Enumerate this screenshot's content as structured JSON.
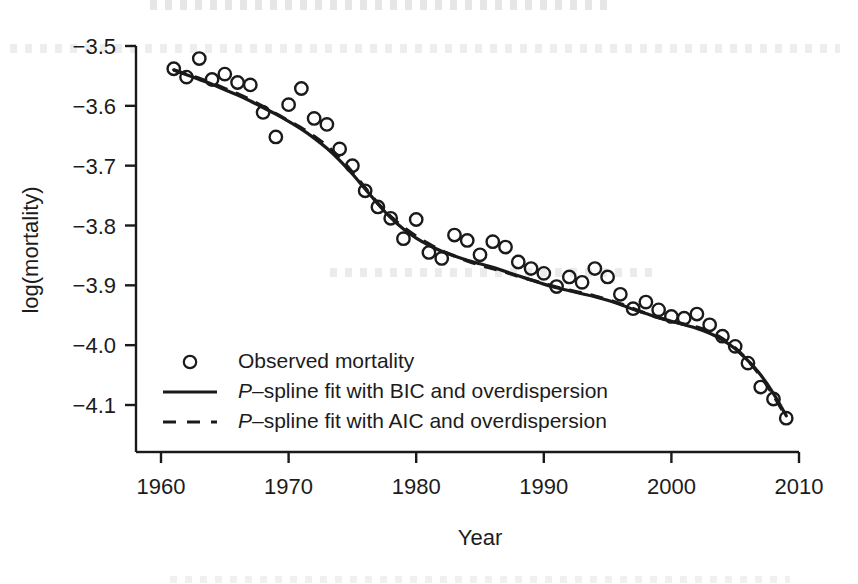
{
  "chart_data": {
    "type": "scatter",
    "title": "",
    "xlabel": "Year",
    "ylabel": "log(mortality)",
    "xlim": [
      1959.0,
      2010.6
    ],
    "ylim": [
      -4.155,
      -3.47
    ],
    "xticks": [
      1960,
      1970,
      1980,
      1990,
      2000,
      2010
    ],
    "xtick_labels": [
      "1960",
      "1970",
      "1980",
      "1990",
      "2000",
      "2010"
    ],
    "yticks": [
      -3.5,
      -3.6,
      -3.7,
      -3.8,
      -3.9,
      -4.0,
      -4.1
    ],
    "ytick_labels": [
      "−3.5",
      "−3.6",
      "−3.7",
      "−3.8",
      "−3.9",
      "−4.0",
      "−4.1"
    ],
    "grid": false,
    "legend_position": "bottom-left",
    "series": [
      {
        "name": "Observed mortality",
        "type": "scatter",
        "marker": "open-circle",
        "color": "#1a1a1a",
        "x": [
          1961,
          1962,
          1963,
          1964,
          1965,
          1966,
          1967,
          1968,
          1969,
          1970,
          1971,
          1972,
          1973,
          1974,
          1975,
          1976,
          1977,
          1978,
          1979,
          1980,
          1981,
          1982,
          1983,
          1984,
          1985,
          1986,
          1987,
          1988,
          1989,
          1990,
          1991,
          1992,
          1993,
          1994,
          1995,
          1996,
          1997,
          1998,
          1999,
          2000,
          2001,
          2002,
          2003,
          2004,
          2005,
          2006,
          2007,
          2008,
          2009
        ],
        "y": [
          -3.538,
          -3.552,
          -3.521,
          -3.556,
          -3.547,
          -3.561,
          -3.565,
          -3.611,
          -3.652,
          -3.598,
          -3.571,
          -3.621,
          -3.631,
          -3.672,
          -3.7,
          -3.742,
          -3.769,
          -3.788,
          -3.822,
          -3.79,
          -3.845,
          -3.855,
          -3.816,
          -3.825,
          -3.849,
          -3.827,
          -3.836,
          -3.861,
          -3.872,
          -3.88,
          -3.902,
          -3.886,
          -3.895,
          -3.872,
          -3.886,
          -3.915,
          -3.939,
          -3.928,
          -3.941,
          -3.952,
          -3.955,
          -3.948,
          -3.966,
          -3.985,
          -4.002,
          -4.03,
          -4.07,
          -4.09,
          -4.122
        ]
      },
      {
        "name": "P-spline fit with BIC and overdispersion",
        "type": "line",
        "style": "solid",
        "color": "#1a1a1a",
        "x": [
          1961,
          1962,
          1963,
          1964,
          1965,
          1966,
          1967,
          1968,
          1969,
          1970,
          1971,
          1972,
          1973,
          1974,
          1975,
          1976,
          1977,
          1978,
          1979,
          1980,
          1981,
          1982,
          1983,
          1984,
          1985,
          1986,
          1987,
          1988,
          1989,
          1990,
          1991,
          1992,
          1993,
          1994,
          1995,
          1996,
          1997,
          1998,
          1999,
          2000,
          2001,
          2002,
          2003,
          2004,
          2005,
          2006,
          2007,
          2008,
          2009
        ],
        "y": [
          -3.54,
          -3.548,
          -3.556,
          -3.564,
          -3.573,
          -3.582,
          -3.592,
          -3.603,
          -3.614,
          -3.626,
          -3.639,
          -3.654,
          -3.671,
          -3.691,
          -3.714,
          -3.739,
          -3.764,
          -3.787,
          -3.806,
          -3.821,
          -3.833,
          -3.843,
          -3.851,
          -3.858,
          -3.864,
          -3.87,
          -3.877,
          -3.884,
          -3.891,
          -3.898,
          -3.904,
          -3.909,
          -3.914,
          -3.919,
          -3.925,
          -3.932,
          -3.94,
          -3.947,
          -3.954,
          -3.96,
          -3.966,
          -3.972,
          -3.98,
          -3.991,
          -4.006,
          -4.026,
          -4.05,
          -4.081,
          -4.118
        ]
      },
      {
        "name": "P-spline fit with AIC and overdispersion",
        "type": "line",
        "style": "dashed",
        "color": "#1a1a1a",
        "x": [
          1961,
          1962,
          1963,
          1964,
          1965,
          1966,
          1967,
          1968,
          1969,
          1970,
          1971,
          1972,
          1973,
          1974,
          1975,
          1976,
          1977,
          1978,
          1979,
          1980,
          1981,
          1982,
          1983,
          1984,
          1985,
          1986,
          1987,
          1988,
          1989,
          1990,
          1991,
          1992,
          1993,
          1994,
          1995,
          1996,
          1997,
          1998,
          1999,
          2000,
          2001,
          2002,
          2003,
          2004,
          2005,
          2006,
          2007,
          2008,
          2009
        ],
        "y": [
          -3.54,
          -3.547,
          -3.554,
          -3.562,
          -3.571,
          -3.58,
          -3.59,
          -3.601,
          -3.613,
          -3.625,
          -3.637,
          -3.651,
          -3.667,
          -3.687,
          -3.711,
          -3.737,
          -3.763,
          -3.785,
          -3.803,
          -3.818,
          -3.831,
          -3.842,
          -3.851,
          -3.859,
          -3.866,
          -3.872,
          -3.878,
          -3.885,
          -3.891,
          -3.897,
          -3.903,
          -3.908,
          -3.913,
          -3.918,
          -3.924,
          -3.931,
          -3.939,
          -3.947,
          -3.954,
          -3.96,
          -3.965,
          -3.97,
          -3.978,
          -3.989,
          -4.005,
          -4.026,
          -4.052,
          -4.084,
          -4.12
        ]
      }
    ]
  },
  "axes": {
    "y_axis_title": "log(mortality)",
    "x_axis_title": "Year"
  },
  "legend": {
    "items": [
      {
        "key": "observed-mortality",
        "marker": "open-circle",
        "label_plain": "Observed mortality",
        "label_prefix": "",
        "label_rest": "Observed mortality"
      },
      {
        "key": "bic-fit",
        "marker": "solid-line",
        "label_plain": "P-spline fit with BIC and overdispersion",
        "label_prefix": "P",
        "label_rest": "–spline fit with BIC and overdispersion"
      },
      {
        "key": "aic-fit",
        "marker": "dashed-line",
        "label_plain": "P-spline fit with AIC and overdispersion",
        "label_prefix": "P",
        "label_rest": "–spline fit with AIC and overdispersion"
      }
    ]
  },
  "style": {
    "ink_color": "#1a1a1a",
    "background": "#ffffff"
  }
}
